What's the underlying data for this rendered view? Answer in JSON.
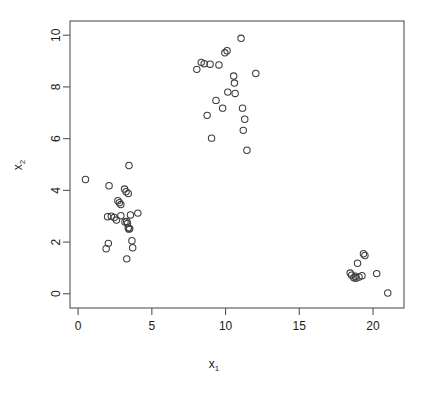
{
  "chart_data": {
    "type": "scatter",
    "title": "",
    "xlabel": "x₁",
    "ylabel": "x₂",
    "xlabel_base": "x",
    "xlabel_sub": "1",
    "ylabel_base": "x",
    "ylabel_sub": "2",
    "xlim": [
      -0.55,
      22.1
    ],
    "ylim": [
      -0.55,
      10.55
    ],
    "xticks": [
      0,
      5,
      10,
      15,
      20
    ],
    "xtick_labels": [
      "0",
      "5",
      "10",
      "15",
      "20"
    ],
    "yticks": [
      0,
      2,
      4,
      6,
      8,
      10
    ],
    "ytick_labels": [
      "0",
      "2",
      "4",
      "6",
      "8",
      "10"
    ],
    "grid": false,
    "legend": null,
    "marker": "open-circle",
    "marker_radius": 3.2,
    "marker_color": "#3c3c3c",
    "frame_color": "#555555",
    "background": "#ffffff",
    "n_points": 60,
    "series": [
      {
        "name": "observations",
        "points": [
          [
            0.5,
            4.42
          ],
          [
            1.9,
            1.74
          ],
          [
            2.1,
            4.18
          ],
          [
            2.05,
            1.95
          ],
          [
            2.0,
            2.98
          ],
          [
            2.25,
            3.0
          ],
          [
            2.45,
            2.95
          ],
          [
            2.6,
            2.85
          ],
          [
            2.7,
            3.6
          ],
          [
            2.8,
            3.52
          ],
          [
            2.9,
            3.45
          ],
          [
            3.15,
            4.05
          ],
          [
            3.25,
            3.95
          ],
          [
            3.4,
            3.88
          ],
          [
            3.45,
            4.96
          ],
          [
            3.3,
            2.8
          ],
          [
            3.35,
            2.72
          ],
          [
            3.4,
            2.55
          ],
          [
            3.45,
            2.5
          ],
          [
            3.5,
            2.52
          ],
          [
            3.55,
            3.05
          ],
          [
            3.3,
            1.35
          ],
          [
            3.65,
            2.05
          ],
          [
            3.7,
            1.78
          ],
          [
            4.05,
            3.12
          ],
          [
            2.9,
            3.02
          ],
          [
            3.18,
            2.78
          ],
          [
            8.05,
            8.68
          ],
          [
            8.35,
            8.95
          ],
          [
            8.55,
            8.9
          ],
          [
            8.75,
            6.9
          ],
          [
            8.95,
            8.88
          ],
          [
            9.05,
            6.02
          ],
          [
            9.35,
            7.48
          ],
          [
            9.55,
            8.85
          ],
          [
            9.95,
            9.32
          ],
          [
            10.1,
            9.4
          ],
          [
            9.8,
            7.18
          ],
          [
            10.15,
            7.8
          ],
          [
            10.55,
            8.42
          ],
          [
            10.6,
            8.15
          ],
          [
            10.65,
            7.75
          ],
          [
            11.05,
            9.88
          ],
          [
            11.15,
            7.18
          ],
          [
            11.2,
            6.32
          ],
          [
            11.3,
            6.75
          ],
          [
            11.45,
            5.55
          ],
          [
            12.05,
            8.52
          ],
          [
            18.45,
            0.8
          ],
          [
            18.55,
            0.72
          ],
          [
            18.7,
            0.62
          ],
          [
            18.8,
            0.68
          ],
          [
            18.85,
            0.6
          ],
          [
            18.95,
            1.18
          ],
          [
            19.05,
            0.65
          ],
          [
            19.25,
            0.7
          ],
          [
            19.35,
            1.55
          ],
          [
            19.45,
            1.48
          ],
          [
            20.25,
            0.78
          ],
          [
            21.0,
            0.03
          ]
        ]
      }
    ]
  },
  "figure": {
    "axis_color": "#555555",
    "point_stroke": "#3c3c3c"
  }
}
